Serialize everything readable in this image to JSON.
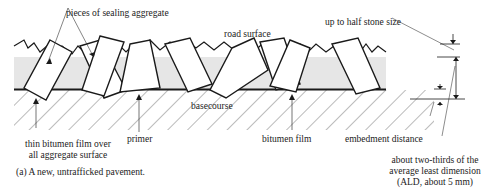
{
  "diagram": {
    "caption": "(a) A new, untrafficked pavement.",
    "labels": {
      "aggregate": "pieces of sealing aggregate",
      "road_surface": "road surface",
      "half_stone": "up to half stone size",
      "basecourse": "basecourse",
      "thin_film_line1": "thin bitumen film over",
      "thin_film_line2": "all aggregate surface",
      "primer": "primer",
      "bitumen_film": "bitumen film",
      "embedment": "embedment distance",
      "ald_line1": "about two-thirds of the",
      "ald_line2": "average least dimension",
      "ald_line3": "(ALD, about 5 mm)"
    },
    "colors": {
      "line": "#1a1a1a",
      "bitumen_fill": "#e6e6e6",
      "hatch": "#555555"
    }
  }
}
